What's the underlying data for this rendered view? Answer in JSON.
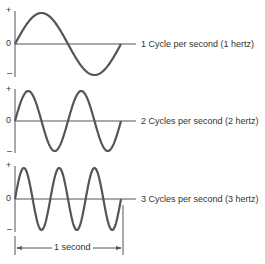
{
  "panels": [
    {
      "label": "1 Cycle per second (1 hertz)",
      "cycles": 1,
      "plus": "+",
      "zero": "0",
      "minus": "–"
    },
    {
      "label": "2 Cycles per second (2 hertz)",
      "cycles": 2,
      "plus": "+",
      "zero": "0",
      "minus": "–"
    },
    {
      "label": "3 Cycles per second (3 hertz)",
      "cycles": 3,
      "plus": "+",
      "zero": "0",
      "minus": "–"
    }
  ],
  "duration_label": "1 second",
  "colors": {
    "wave": "#555555",
    "axis": "#555555",
    "text": "#333333"
  }
}
